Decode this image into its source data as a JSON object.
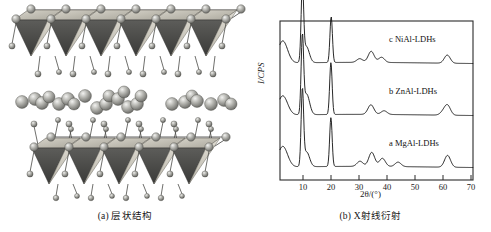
{
  "figure": {
    "panel_a": {
      "caption": "(a) 层状结构",
      "description_icons": {
        "layer_sheet": "octahedral-layer-icon",
        "interlayer_ion": "interlayer-sphere-icon",
        "hydroxyl": "hydroxyl-sphere-icon"
      }
    },
    "panel_b": {
      "caption": "(b) X射线衍射"
    }
  },
  "chart_data": {
    "type": "line",
    "title": "",
    "xlabel": "2θ/(°)",
    "ylabel": "I/CPS",
    "xlim": [
      2,
      71
    ],
    "ylim": [
      0,
      3
    ],
    "xticks": [
      "10",
      "20",
      "30",
      "40",
      "50",
      "60",
      "70"
    ],
    "xtick_values": [
      10,
      20,
      30,
      40,
      50,
      60,
      70
    ],
    "yticks": [],
    "grid": false,
    "legend_position": "inline-right",
    "annotations": [
      {
        "text": "c  NiAl-LDHs",
        "series": "c"
      },
      {
        "text": "b  ZnAl-LDHs",
        "series": "b"
      },
      {
        "text": "a  MgAl-LDHs",
        "series": "a"
      }
    ],
    "series": [
      {
        "name": "c  NiAl-LDHs",
        "label": "c  NiAl-LDHs",
        "offset_index": 2,
        "peaks": [
          {
            "two_theta": 3.0,
            "rel_intensity": 0.3
          },
          {
            "two_theta": 10.0,
            "rel_intensity": 1.0
          },
          {
            "two_theta": 11.4,
            "rel_intensity": 0.22
          },
          {
            "two_theta": 20.3,
            "rel_intensity": 0.62
          },
          {
            "two_theta": 30.5,
            "rel_intensity": 0.05
          },
          {
            "two_theta": 34.6,
            "rel_intensity": 0.15
          },
          {
            "two_theta": 38.3,
            "rel_intensity": 0.07
          },
          {
            "two_theta": 61.8,
            "rel_intensity": 0.11
          }
        ]
      },
      {
        "name": "b  ZnAl-LDHs",
        "label": "b  ZnAl-LDHs",
        "offset_index": 1,
        "peaks": [
          {
            "two_theta": 3.0,
            "rel_intensity": 0.26
          },
          {
            "two_theta": 10.0,
            "rel_intensity": 1.0
          },
          {
            "two_theta": 11.5,
            "rel_intensity": 0.28
          },
          {
            "two_theta": 20.2,
            "rel_intensity": 0.7
          },
          {
            "two_theta": 34.5,
            "rel_intensity": 0.13
          },
          {
            "two_theta": 39.2,
            "rel_intensity": 0.05
          },
          {
            "two_theta": 60.3,
            "rel_intensity": 0.04
          },
          {
            "two_theta": 61.9,
            "rel_intensity": 0.13
          }
        ]
      },
      {
        "name": "a  MgAl-LDHs",
        "label": "a  MgAl-LDHs",
        "offset_index": 0,
        "peaks": [
          {
            "two_theta": 3.0,
            "rel_intensity": 0.28
          },
          {
            "two_theta": 10.0,
            "rel_intensity": 1.0
          },
          {
            "two_theta": 11.5,
            "rel_intensity": 0.2
          },
          {
            "two_theta": 20.2,
            "rel_intensity": 0.66
          },
          {
            "two_theta": 30.6,
            "rel_intensity": 0.07
          },
          {
            "two_theta": 34.8,
            "rel_intensity": 0.19
          },
          {
            "two_theta": 38.6,
            "rel_intensity": 0.11
          },
          {
            "two_theta": 44.2,
            "rel_intensity": 0.06
          },
          {
            "two_theta": 61.9,
            "rel_intensity": 0.16
          }
        ]
      }
    ]
  },
  "colors": {
    "background": "#ffffff",
    "line": "#111111",
    "frame": "#2a2a2a",
    "sheet_light": "#cfcbc0",
    "sheet_dark": "#4a4a48",
    "sphere": "#9a9a96",
    "sphere_highlight": "#dedede"
  }
}
